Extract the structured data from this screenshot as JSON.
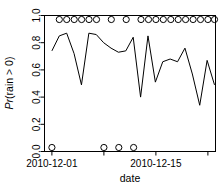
{
  "chart_data": {
    "type": "line",
    "title": "",
    "subtitle": "",
    "xlabel": "date",
    "ylabel": "Pr(rain > 0)",
    "ylabel_parts": {
      "italic": "Pr",
      "rest": "(rain > 0)"
    },
    "ylim": [
      0.0,
      1.0
    ],
    "xlim": [
      1,
      23
    ],
    "grid": false,
    "legend": null,
    "y_ticks": [
      0.0,
      0.2,
      0.4,
      0.6,
      0.8,
      1.0
    ],
    "y_tick_labels": [
      "0.0",
      "0.2",
      "0.4",
      "0.6",
      "0.8",
      "1.0"
    ],
    "x_ticks": [
      1,
      8,
      15,
      22
    ],
    "x_tick_labels": [
      "2010-12-01",
      "",
      "2010-12-15",
      ""
    ],
    "x_labeled_ticks": [
      {
        "x": 1,
        "label": "2010-12-01"
      },
      {
        "x": 15,
        "label": "2010-12-15"
      }
    ],
    "series": [
      {
        "name": "Pr(rain > 0)",
        "style": "line",
        "x": [
          1,
          2,
          3,
          4,
          5,
          6,
          7,
          8,
          9,
          10,
          11,
          12,
          13,
          14,
          15,
          16,
          17,
          18,
          19,
          20,
          21,
          22,
          23
        ],
        "values": [
          0.74,
          0.85,
          0.87,
          0.72,
          0.49,
          0.87,
          0.86,
          0.8,
          0.76,
          0.73,
          0.74,
          0.84,
          0.4,
          0.85,
          0.51,
          0.66,
          0.68,
          0.66,
          0.76,
          0.57,
          0.34,
          0.67,
          0.49
        ]
      },
      {
        "name": "observed rain = yes",
        "style": "points",
        "marker": "open-circle",
        "y_level": 1.0,
        "x": [
          2,
          3,
          4,
          5,
          6,
          7,
          9,
          11,
          13,
          14,
          15,
          16,
          17,
          18,
          19,
          20,
          21,
          22,
          23
        ]
      },
      {
        "name": "observed rain = no",
        "style": "points",
        "marker": "open-circle",
        "y_level": 0.0,
        "x": [
          1,
          8,
          10,
          12
        ]
      }
    ]
  },
  "axes": {
    "y_axis_label": "Pr(rain > 0)",
    "x_axis_label": "date"
  },
  "colors": {
    "line": "#000000",
    "marker": "#000000",
    "background": "#ffffff",
    "axis": "#000000"
  }
}
